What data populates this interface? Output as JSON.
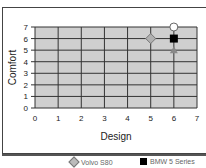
{
  "chart_data": {
    "type": "scatter",
    "title": "",
    "xlabel": "Design",
    "ylabel": "Comfort",
    "xlim": [
      0,
      7
    ],
    "ylim": [
      0,
      7
    ],
    "xticks": [
      "0",
      "1",
      "2",
      "3",
      "4",
      "5",
      "6",
      "7"
    ],
    "yticks": [
      "0",
      "1",
      "2",
      "3",
      "4",
      "5",
      "6",
      "7"
    ],
    "grid": true,
    "legend_position": "bottom",
    "series": [
      {
        "name": "Volvo S80",
        "marker": "diamond",
        "color": "#b0b0b0",
        "points": [
          {
            "x": 5,
            "y": 6
          }
        ]
      },
      {
        "name": "BMW 5 Series",
        "marker": "square",
        "color": "#000000",
        "points": [
          {
            "x": 6,
            "y": 6
          }
        ]
      },
      {
        "name": "",
        "marker": "circle",
        "color": "#ffffff",
        "points": [
          {
            "x": 6,
            "y": 7
          }
        ]
      },
      {
        "name": "",
        "marker": "triangle",
        "color": "#888888",
        "points": [
          {
            "x": 6,
            "y": 5
          }
        ]
      }
    ]
  },
  "legend": {
    "items": [
      {
        "label": "Volvo S80",
        "marker": "diamond"
      },
      {
        "label": "BMW 5 Series",
        "marker": "square"
      }
    ]
  }
}
